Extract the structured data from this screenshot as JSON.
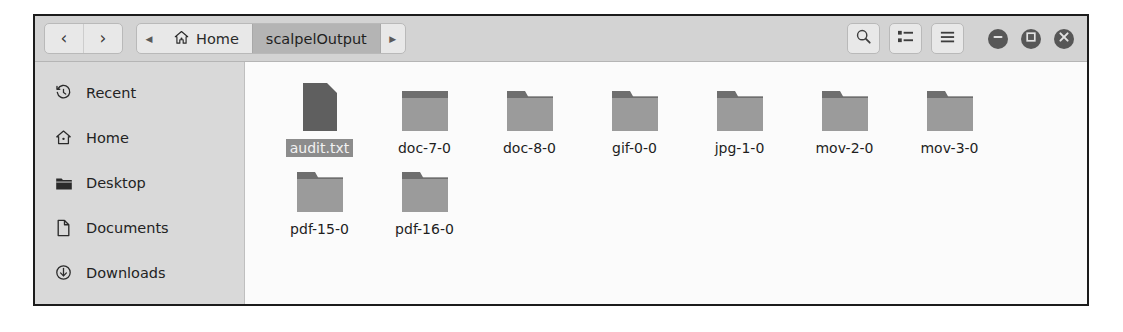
{
  "window": {
    "title": "scalpelOutput"
  },
  "toolbar": {
    "back_label": "‹",
    "forward_label": "›",
    "breadcrumb_prev_label": "◀",
    "breadcrumb_next_label": "▶",
    "crumbs": [
      {
        "label": "Home",
        "icon": "home-icon",
        "current": false
      },
      {
        "label": "scalpelOutput",
        "icon": "",
        "current": true
      }
    ],
    "buttons": [
      {
        "name": "search-button",
        "icon": "search-icon"
      },
      {
        "name": "view-list-button",
        "icon": "list-view-icon"
      },
      {
        "name": "menu-button",
        "icon": "hamburger-menu-icon"
      }
    ],
    "window_controls": [
      {
        "name": "minimize-button",
        "icon": "minimize-icon"
      },
      {
        "name": "maximize-button",
        "icon": "maximize-icon"
      },
      {
        "name": "close-button",
        "icon": "close-icon"
      }
    ]
  },
  "sidebar": {
    "items": [
      {
        "label": "Recent",
        "icon": "clock-icon"
      },
      {
        "label": "Home",
        "icon": "home-icon"
      },
      {
        "label": "Desktop",
        "icon": "folder-filled-icon"
      },
      {
        "label": "Documents",
        "icon": "document-icon"
      },
      {
        "label": "Downloads",
        "icon": "download-arrow-icon"
      }
    ]
  },
  "files": {
    "rows": [
      [
        {
          "name": "audit.txt",
          "type": "file",
          "selected": true
        },
        {
          "name": "doc-7-0",
          "type": "folder",
          "selected": false
        },
        {
          "name": "doc-8-0",
          "type": "folder",
          "selected": false
        },
        {
          "name": "gif-0-0",
          "type": "folder",
          "selected": false
        },
        {
          "name": "jpg-1-0",
          "type": "folder",
          "selected": false
        },
        {
          "name": "mov-2-0",
          "type": "folder",
          "selected": false
        },
        {
          "name": "mov-3-0",
          "type": "folder",
          "selected": false
        }
      ],
      [
        {
          "name": "pdf-15-0",
          "type": "folder",
          "selected": false
        },
        {
          "name": "pdf-16-0",
          "type": "folder",
          "selected": false
        }
      ]
    ]
  },
  "colors": {
    "window_border": "#1c1c1c",
    "toolbar_bg": "#d3d3d3",
    "sidebar_bg": "#d9d9d9",
    "pane_bg": "#fbfbfb",
    "crumb_active_bg": "#b4b4b4",
    "selection_bg": "#8c8c8c",
    "folder_body": "#9b9b9b",
    "folder_tab": "#6e6e6e",
    "file_icon": "#5f5f5f"
  }
}
